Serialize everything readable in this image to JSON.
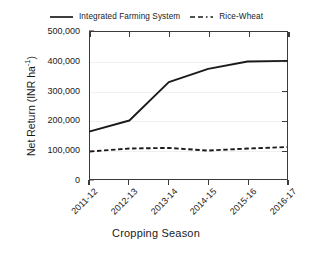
{
  "chart_data": {
    "type": "line",
    "title": "",
    "subtitle": "",
    "xlabel": "Cropping Season",
    "ylabel": "Net Return (INR ha-1)",
    "ylabel_base": "Net Return (INR ha",
    "ylabel_sup": "-1",
    "ylabel_tail": ")",
    "categories": [
      "2011-12",
      "2012-13",
      "2013-14",
      "2014-15",
      "2015-16",
      "2016-17"
    ],
    "series": [
      {
        "name": "Integrated Farming System",
        "style": "solid",
        "color": "#1a1a1a",
        "values": [
          163000,
          200000,
          330000,
          375000,
          400000,
          402000
        ]
      },
      {
        "name": "Rice-Wheat",
        "style": "dashed",
        "color": "#1a1a1a",
        "values": [
          95000,
          105000,
          107000,
          98000,
          105000,
          110000
        ]
      }
    ],
    "ylim": [
      0,
      500000
    ],
    "yticks": [
      0,
      100000,
      200000,
      300000,
      400000,
      500000
    ],
    "ytick_labels": [
      "0",
      "100,000",
      "200,000",
      "300,000",
      "400,000",
      "500,000"
    ],
    "grid": true,
    "grid_axis": "y",
    "legend_position": "top-center",
    "frame": "full-box",
    "xtick_rotation": -45
  },
  "legend": {
    "entries": [
      {
        "label": "Integrated Farming System",
        "style": "solid"
      },
      {
        "label": "Rice-Wheat",
        "style": "dashed"
      }
    ]
  }
}
